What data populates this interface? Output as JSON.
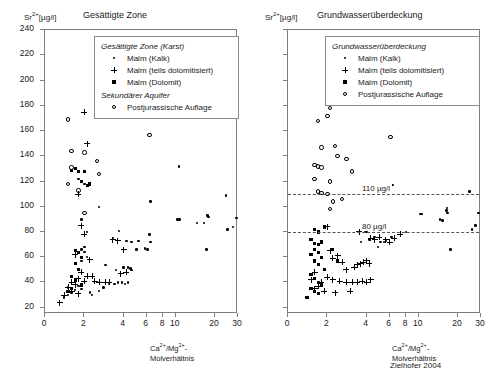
{
  "figure": {
    "credit": "Zielhofer 2004",
    "y_axis_label_prefix": "Sr",
    "y_axis_label_sup": "2+",
    "y_axis_label_unit": "[µg/l]",
    "x_axis_label_line1_a": "Ca",
    "x_axis_label_line1_sup1": "2+",
    "x_axis_label_line1_b": "/Mg",
    "x_axis_label_line1_sup2": "2+",
    "x_axis_label_line1_c": "-",
    "x_axis_label_line2": "Molverhältnis"
  },
  "panels": [
    {
      "id": "left",
      "title": "Gesättigte Zone",
      "legend": {
        "heading1": "Gesättigte Zone (Karst)",
        "heading2": "Sekundärer Aquifer",
        "items_group1": [
          {
            "symbol": "dot",
            "label": "Malm (Kalk)"
          },
          {
            "symbol": "plus",
            "label": "Malm (teils dolomitisiert)"
          },
          {
            "symbol": "square",
            "label": "Malm (Dolomit)"
          }
        ],
        "items_group2": [
          {
            "symbol": "circle",
            "label": "Postjurassische Auflage"
          }
        ]
      }
    },
    {
      "id": "right",
      "title": "Grundwasserüberdeckung",
      "legend": {
        "heading1": "Grundwasserüberdeckung",
        "heading2": "",
        "items_group1": [
          {
            "symbol": "dot",
            "label": "Malm (Kalk)"
          },
          {
            "symbol": "plus",
            "label": "Malm (teils dolomitisiert)"
          },
          {
            "symbol": "square",
            "label": "Malm (Dolomit)"
          },
          {
            "symbol": "circle",
            "label": "Postjurassische Auflage"
          }
        ],
        "items_group2": []
      },
      "reference_lines": [
        {
          "value": 110,
          "label": "110 µg/l"
        },
        {
          "value": 80,
          "label": "80 µg/l"
        }
      ]
    }
  ],
  "chart_data": {
    "type": "scatter",
    "xlabel": "Ca2+/Mg2+-Molverhältnis",
    "ylabel": "Sr2+ [µg/l]",
    "xscale": "log",
    "xlim": [
      1,
      30
    ],
    "ylim": [
      15,
      240
    ],
    "yticks": [
      20,
      40,
      60,
      80,
      100,
      120,
      140,
      160,
      180,
      200,
      220,
      240
    ],
    "xticks": [
      1,
      2,
      4,
      6,
      8,
      10,
      20,
      30
    ],
    "xticklabels": [
      "0",
      "2",
      "4",
      "6",
      "8",
      "10",
      "20",
      "30"
    ],
    "grid": false,
    "legend_position": "top-center",
    "panels": [
      {
        "name": "Gesättigte Zone",
        "series": [
          {
            "name": "Malm (Kalk)",
            "symbol": "dot",
            "points": [
              [
                6.4,
                104
              ],
              [
                10.6,
                132
              ],
              [
                2.6,
                100
              ],
              [
                1.9,
                90
              ],
              [
                2.1,
                80
              ],
              [
                3.7,
                81
              ],
              [
                3.3,
                75
              ],
              [
                4.2,
                73
              ],
              [
                4.6,
                72
              ],
              [
                5.2,
                73
              ],
              [
                5.0,
                66
              ],
              [
                5.8,
                67
              ],
              [
                6.3,
                78
              ],
              [
                6.4,
                72
              ],
              [
                6.1,
                66
              ],
              [
                2.9,
                54
              ],
              [
                3.5,
                50
              ],
              [
                4.0,
                52
              ],
              [
                4.3,
                52
              ],
              [
                4.5,
                51
              ],
              [
                4.6,
                50
              ],
              [
                3.1,
                39
              ],
              [
                3.4,
                39
              ],
              [
                3.6,
                40
              ],
              [
                3.9,
                40
              ],
              [
                4.1,
                39
              ],
              [
                4.3,
                40
              ],
              [
                2.8,
                36
              ],
              [
                2.6,
                33
              ],
              [
                2.2,
                32
              ],
              [
                2.3,
                30
              ],
              [
                1.9,
                35
              ],
              [
                1.8,
                37
              ],
              [
                1.7,
                34
              ],
              [
                1.6,
                32
              ],
              [
                1.5,
                36
              ],
              [
                1.5,
                30
              ],
              [
                1.4,
                28
              ],
              [
                10.3,
                90
              ],
              [
                10.7,
                90
              ],
              [
                14.6,
                87
              ],
              [
                16.4,
                87
              ],
              [
                17.5,
                93
              ],
              [
                17.8,
                92
              ],
              [
                17.2,
                66
              ],
              [
                24.3,
                109
              ],
              [
                25.0,
                82
              ],
              [
                27.5,
                84
              ],
              [
                29.2,
                91
              ],
              [
                2.0,
                68
              ],
              [
                1.9,
                66
              ],
              [
                2.0,
                64
              ],
              [
                2.1,
                60
              ],
              [
                1.9,
                57
              ],
              [
                2.0,
                118
              ],
              [
                1.8,
                122
              ]
            ]
          },
          {
            "name": "Malm (teils dolomitisiert)",
            "symbol": "plus",
            "points": [
              [
                2.0,
                175
              ],
              [
                2.1,
                150
              ],
              [
                1.8,
                110
              ],
              [
                1.9,
                85
              ],
              [
                2.0,
                78
              ],
              [
                1.7,
                62
              ],
              [
                2.2,
                58
              ],
              [
                1.9,
                48
              ],
              [
                2.1,
                45
              ],
              [
                2.3,
                45
              ],
              [
                1.8,
                43
              ],
              [
                2.0,
                41
              ],
              [
                1.6,
                40
              ],
              [
                2.4,
                41
              ],
              [
                2.6,
                40
              ],
              [
                2.9,
                40
              ],
              [
                3.1,
                40
              ],
              [
                1.7,
                38
              ],
              [
                1.5,
                36
              ],
              [
                1.6,
                33
              ],
              [
                1.8,
                31
              ],
              [
                1.4,
                30
              ],
              [
                1.3,
                24
              ],
              [
                4.2,
                48
              ],
              [
                3.8,
                47
              ],
              [
                3.3,
                74
              ],
              [
                3.6,
                73
              ],
              [
                4.0,
                66
              ]
            ]
          },
          {
            "name": "Malm (Dolomit)",
            "symbol": "square",
            "points": [
              [
                2.2,
                118
              ],
              [
                1.8,
                128
              ],
              [
                1.7,
                130
              ],
              [
                1.6,
                129
              ],
              [
                2.0,
                128
              ],
              [
                1.9,
                120
              ],
              [
                2.1,
                117
              ],
              [
                1.7,
                65
              ],
              [
                1.8,
                64
              ],
              [
                1.9,
                60
              ],
              [
                1.7,
                55
              ],
              [
                1.8,
                50
              ],
              [
                1.6,
                45
              ],
              [
                1.7,
                42
              ],
              [
                1.9,
                38
              ],
              [
                1.6,
                35
              ],
              [
                1.5,
                33
              ]
            ]
          },
          {
            "name": "Postjurassische Auflage",
            "symbol": "circle",
            "points": [
              [
                2.7,
                229
              ],
              [
                1.5,
                169
              ],
              [
                1.6,
                144
              ],
              [
                2.0,
                143
              ],
              [
                2.5,
                136
              ],
              [
                2.6,
                126
              ],
              [
                1.6,
                131
              ],
              [
                1.5,
                118
              ],
              [
                1.8,
                113
              ],
              [
                2.0,
                95
              ],
              [
                6.3,
                157
              ]
            ]
          }
        ]
      },
      {
        "name": "Grundwasserüberdeckung",
        "series": [
          {
            "name": "Malm (Kalk)",
            "symbol": "dot",
            "points": [
              [
                6.3,
                117
              ],
              [
                10.2,
                94
              ],
              [
                10.5,
                94
              ],
              [
                14.5,
                90
              ],
              [
                15.2,
                89
              ],
              [
                16.3,
                97
              ],
              [
                16.6,
                95
              ],
              [
                16.5,
                99
              ],
              [
                17.5,
                66
              ],
              [
                24.5,
                112
              ],
              [
                25.5,
                82
              ],
              [
                27.2,
                85
              ],
              [
                28.8,
                95
              ],
              [
                8.0,
                80
              ],
              [
                6.2,
                76
              ],
              [
                5.6,
                73
              ],
              [
                5.1,
                72
              ],
              [
                4.6,
                76
              ],
              [
                4.2,
                74
              ],
              [
                3.6,
                72
              ],
              [
                4.9,
                68
              ],
              [
                5.4,
                72
              ],
              [
                3.9,
                80
              ],
              [
                4.0,
                80
              ]
            ]
          },
          {
            "name": "Malm (teils dolomitisiert)",
            "symbol": "plus",
            "points": [
              [
                3.5,
                80
              ],
              [
                4.3,
                75
              ],
              [
                4.6,
                74
              ],
              [
                5.0,
                76
              ],
              [
                5.6,
                74
              ],
              [
                6.0,
                72
              ],
              [
                6.5,
                75
              ],
              [
                7.2,
                78
              ],
              [
                2.4,
                61
              ],
              [
                2.6,
                56
              ],
              [
                2.1,
                65
              ],
              [
                2.2,
                59
              ],
              [
                2.8,
                50
              ],
              [
                3.2,
                52
              ],
              [
                3.4,
                54
              ],
              [
                3.6,
                55
              ],
              [
                3.8,
                56
              ],
              [
                4.0,
                57
              ],
              [
                4.2,
                55
              ],
              [
                2.0,
                44
              ],
              [
                2.2,
                42
              ],
              [
                2.5,
                41
              ],
              [
                2.8,
                40
              ],
              [
                3.1,
                40
              ],
              [
                3.4,
                40
              ],
              [
                3.7,
                41
              ],
              [
                4.0,
                40
              ],
              [
                4.3,
                42
              ],
              [
                1.8,
                40
              ],
              [
                1.7,
                37
              ],
              [
                1.6,
                35
              ],
              [
                1.9,
                33
              ],
              [
                2.3,
                32
              ],
              [
                3.0,
                33
              ],
              [
                1.5,
                42
              ],
              [
                1.6,
                48
              ],
              [
                2.0,
                84
              ],
              [
                4.3,
                84
              ]
            ]
          },
          {
            "name": "Malm (Dolomit)",
            "symbol": "square",
            "points": [
              [
                1.6,
                82
              ],
              [
                1.7,
                80
              ],
              [
                1.5,
                74
              ],
              [
                1.6,
                71
              ],
              [
                1.7,
                70
              ],
              [
                1.8,
                72
              ],
              [
                1.6,
                66
              ],
              [
                1.7,
                64
              ],
              [
                1.5,
                62
              ],
              [
                1.8,
                60
              ],
              [
                1.6,
                57
              ],
              [
                1.7,
                54
              ],
              [
                1.9,
                50
              ],
              [
                1.5,
                46
              ],
              [
                1.6,
                43
              ],
              [
                1.7,
                40
              ],
              [
                1.8,
                38
              ],
              [
                1.5,
                35
              ],
              [
                1.6,
                33
              ],
              [
                1.7,
                31
              ],
              [
                1.4,
                28
              ],
              [
                2.4,
                57
              ],
              [
                2.2,
                66
              ],
              [
                1.9,
                84
              ]
            ]
          },
          {
            "name": "Postjurassische Auflage",
            "symbol": "circle",
            "points": [
              [
                2.5,
                228
              ],
              [
                2.0,
                172
              ],
              [
                2.1,
                178
              ],
              [
                1.7,
                168
              ],
              [
                1.8,
                147
              ],
              [
                2.3,
                148
              ],
              [
                2.4,
                140
              ],
              [
                1.6,
                133
              ],
              [
                1.7,
                132
              ],
              [
                1.8,
                131
              ],
              [
                2.8,
                138
              ],
              [
                3.1,
                128
              ],
              [
                1.6,
                122
              ],
              [
                2.1,
                120
              ],
              [
                1.7,
                112
              ],
              [
                1.8,
                111
              ],
              [
                2.0,
                110
              ],
              [
                2.2,
                104
              ],
              [
                2.6,
                106
              ],
              [
                2.1,
                98
              ],
              [
                6.1,
                155
              ]
            ]
          }
        ]
      }
    ]
  }
}
